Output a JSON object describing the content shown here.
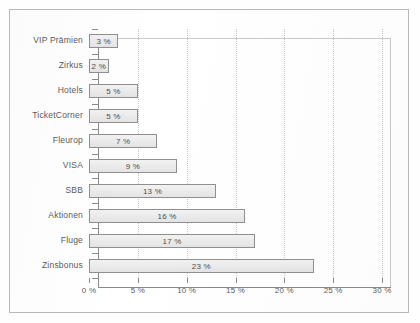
{
  "chart_data": {
    "type": "bar",
    "orientation": "horizontal",
    "title": "",
    "xlabel": "",
    "ylabel": "",
    "categories": [
      "VIP Prämien",
      "Zirkus",
      "Hotels",
      "TicketCorner",
      "Fleurop",
      "VISA",
      "SBB",
      "Aktionen",
      "Fluge",
      "Zinsbonus"
    ],
    "values": [
      3,
      2,
      5,
      5,
      7,
      9,
      13,
      16,
      17,
      23
    ],
    "value_labels": [
      "3 %",
      "2 %",
      "5 %",
      "5 %",
      "7 %",
      "9 %",
      "13 %",
      "16 %",
      "17 %",
      "23 %"
    ],
    "xlim": [
      0,
      30
    ],
    "xticks": [
      0,
      5,
      10,
      15,
      20,
      25,
      30
    ],
    "xtick_labels": [
      "0 %",
      "5 %",
      "10 %",
      "15 %",
      "20 %",
      "25 %",
      "30 %"
    ],
    "grid": "vertical-dotted",
    "legend": "none",
    "colors": {
      "bar_fill": "#ebebeb",
      "bar_border": "#8f8f8f",
      "axis": "#8a8a8a",
      "gridline": "#c5c5c5",
      "text": "#5a5a5a",
      "frame": "#b9b9b9",
      "background": "#ffffff"
    }
  }
}
